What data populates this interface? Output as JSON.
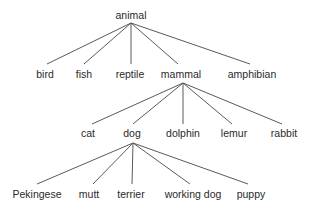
{
  "diagram": {
    "type": "tree",
    "line_color": "#5a5a5a",
    "text_color": "#2a2a2a",
    "root": {
      "label": "animal",
      "x": 131,
      "y": 15,
      "apex": [
        131,
        23
      ],
      "children": [
        {
          "label": "bird",
          "x": 45,
          "y": 74,
          "end": [
            47,
            64
          ]
        },
        {
          "label": "fish",
          "x": 84,
          "y": 74,
          "end": [
            84,
            64
          ]
        },
        {
          "label": "reptile",
          "x": 130,
          "y": 74,
          "end": [
            131,
            64
          ]
        },
        {
          "label": "mammal",
          "x": 181,
          "y": 74,
          "end": [
            178,
            64
          ],
          "apex": [
            183,
            83
          ],
          "children": [
            {
              "label": "cat",
              "x": 88,
              "y": 133,
              "end": [
                92,
                124
              ]
            },
            {
              "label": "dog",
              "x": 132,
              "y": 133,
              "end": [
                133,
                124
              ],
              "apex": [
                133,
                143
              ],
              "children": [
                {
                  "label": "Pekingese",
                  "x": 37,
                  "y": 194,
                  "end": [
                    37,
                    184
                  ]
                },
                {
                  "label": "mutt",
                  "x": 89,
                  "y": 194,
                  "end": [
                    93,
                    184
                  ]
                },
                {
                  "label": "terrier",
                  "x": 131,
                  "y": 194,
                  "end": [
                    132,
                    184
                  ]
                },
                {
                  "label": "working dog",
                  "x": 193,
                  "y": 194,
                  "end": [
                    190,
                    184
                  ]
                },
                {
                  "label": "puppy",
                  "x": 251,
                  "y": 194,
                  "end": [
                    248,
                    184
                  ]
                }
              ]
            },
            {
              "label": "dolphin",
              "x": 183,
              "y": 133,
              "end": [
                183,
                124
              ]
            },
            {
              "label": "lemur",
              "x": 234,
              "y": 133,
              "end": [
                232,
                124
              ]
            },
            {
              "label": "rabbit",
              "x": 284,
              "y": 133,
              "end": [
                282,
                124
              ]
            }
          ]
        },
        {
          "label": "amphibian",
          "x": 252,
          "y": 74,
          "end": [
            250,
            64
          ]
        }
      ]
    }
  }
}
